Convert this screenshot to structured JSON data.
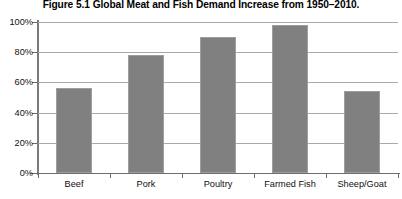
{
  "figure": {
    "number": "Figure 5.1",
    "title": "Global Meat and Fish Demand Increase from 1950–2010."
  },
  "chart_data": {
    "type": "bar",
    "categories": [
      "Beef",
      "Pork",
      "Poultry",
      "Farmed Fish",
      "Sheep/Goat"
    ],
    "values": [
      56,
      78,
      90,
      98,
      54
    ],
    "value_format": "percent",
    "xlabel": "",
    "ylabel": "",
    "ylim": [
      0,
      100
    ],
    "ytick_labels": [
      "0%",
      "20%",
      "40%",
      "60%",
      "80%",
      "100%"
    ],
    "ytick_values": [
      0,
      20,
      40,
      60,
      80,
      100
    ],
    "grid": true,
    "grid_axis": "y",
    "legend": false,
    "series": [
      {
        "name": "Demand Increase",
        "values": [
          56,
          78,
          90,
          98,
          54
        ],
        "color": "#808080"
      }
    ],
    "colors": {
      "bar_fill": "#808080",
      "bar_border": "#9d9d9d",
      "gridline": "#a9a9a9",
      "axis": "#6d6d6d",
      "text": "#111111",
      "background": "#ffffff"
    }
  }
}
